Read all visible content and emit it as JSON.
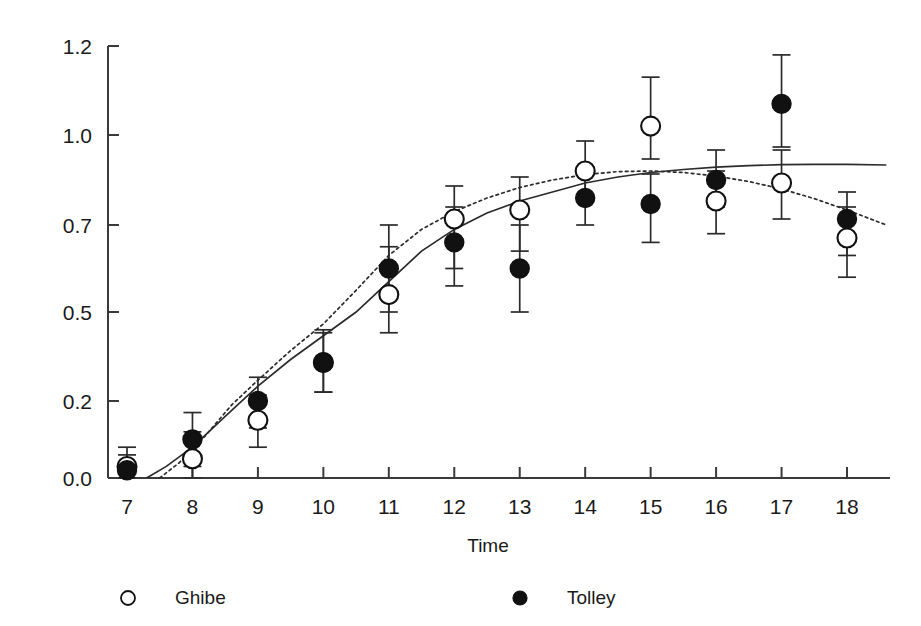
{
  "chart_data": {
    "type": "scatter",
    "title": "",
    "xlabel": "Time",
    "ylabel": "",
    "grid": false,
    "legend_position": "bottom",
    "x": [
      7,
      8,
      9,
      10,
      11,
      12,
      13,
      14,
      15,
      16,
      17,
      18
    ],
    "xtick_labels": [
      "7",
      "8",
      "9",
      "10",
      "11",
      "12",
      "13",
      "14",
      "15",
      "16",
      "17",
      "18"
    ],
    "ytick_labels": [
      "0.0",
      "0.2",
      "0.5",
      "0.7",
      "1.0",
      "1.2"
    ],
    "ytick_values": [
      0.0,
      0.2,
      0.5,
      0.7,
      1.0,
      1.2
    ],
    "xlim": [
      6.6,
      18.6
    ],
    "ylim": [
      0.0,
      1.2
    ],
    "series": [
      {
        "name": "Ghibe",
        "marker": "open-circle",
        "curve": "dotted",
        "values": [
          0.03,
          0.05,
          0.15,
          0.33,
          0.54,
          0.72,
          0.75,
          0.88,
          1.02,
          0.78,
          0.84,
          0.67
        ],
        "err_low": [
          0.03,
          0.05,
          0.07,
          0.1,
          0.11,
          0.12,
          0.11,
          0.1,
          0.1,
          0.1,
          0.12,
          0.09
        ],
        "err_high": [
          0.05,
          0.07,
          0.07,
          0.11,
          0.11,
          0.11,
          0.11,
          0.1,
          0.11,
          0.1,
          0.11,
          0.09
        ]
      },
      {
        "name": "Tolley",
        "marker": "filled-circle",
        "curve": "solid",
        "values": [
          0.02,
          0.1,
          0.2,
          0.33,
          0.6,
          0.66,
          0.6,
          0.79,
          0.77,
          0.85,
          1.07,
          0.72
        ],
        "err_low": [
          0.02,
          0.07,
          0.07,
          0.1,
          0.1,
          0.1,
          0.1,
          0.09,
          0.11,
          0.09,
          0.11,
          0.09
        ],
        "err_high": [
          0.04,
          0.07,
          0.08,
          0.1,
          0.1,
          0.1,
          0.1,
          0.09,
          0.1,
          0.1,
          0.11,
          0.09
        ]
      }
    ],
    "fitted_curves": [
      {
        "name": "Tolley fit",
        "style": "solid",
        "points": [
          [
            7.3,
            0.0
          ],
          [
            7.6,
            0.03
          ],
          [
            8.0,
            0.08
          ],
          [
            8.5,
            0.16
          ],
          [
            9.0,
            0.25
          ],
          [
            9.5,
            0.34
          ],
          [
            10.0,
            0.42
          ],
          [
            10.5,
            0.5
          ],
          [
            11.0,
            0.57
          ],
          [
            11.5,
            0.64
          ],
          [
            12.0,
            0.69
          ],
          [
            12.5,
            0.74
          ],
          [
            13.0,
            0.78
          ],
          [
            13.5,
            0.81
          ],
          [
            14.0,
            0.84
          ],
          [
            14.5,
            0.86
          ],
          [
            15.0,
            0.875
          ],
          [
            15.5,
            0.885
          ],
          [
            16.0,
            0.893
          ],
          [
            16.5,
            0.898
          ],
          [
            17.0,
            0.901
          ],
          [
            17.5,
            0.902
          ],
          [
            18.0,
            0.902
          ],
          [
            18.6,
            0.9
          ]
        ]
      },
      {
        "name": "Ghibe fit",
        "style": "dotted",
        "points": [
          [
            7.5,
            0.0
          ],
          [
            7.8,
            0.04
          ],
          [
            8.2,
            0.11
          ],
          [
            8.6,
            0.19
          ],
          [
            9.0,
            0.27
          ],
          [
            9.5,
            0.37
          ],
          [
            10.0,
            0.46
          ],
          [
            10.5,
            0.55
          ],
          [
            11.0,
            0.63
          ],
          [
            11.5,
            0.69
          ],
          [
            12.0,
            0.745
          ],
          [
            12.5,
            0.79
          ],
          [
            13.0,
            0.825
          ],
          [
            13.5,
            0.85
          ],
          [
            14.0,
            0.868
          ],
          [
            14.5,
            0.878
          ],
          [
            15.0,
            0.88
          ],
          [
            15.5,
            0.875
          ],
          [
            16.0,
            0.863
          ],
          [
            16.5,
            0.845
          ],
          [
            17.0,
            0.82
          ],
          [
            17.5,
            0.788
          ],
          [
            18.0,
            0.75
          ],
          [
            18.6,
            0.7
          ]
        ]
      }
    ],
    "legend": [
      {
        "label": "Ghibe",
        "marker": "open-circle"
      },
      {
        "label": "Tolley",
        "marker": "filled-circle"
      }
    ]
  },
  "colors": {
    "axis": "#3a3a3a",
    "marker_fill": "#111111",
    "marker_open": "#ffffff",
    "curve": "#2b2b2b",
    "background": "#ffffff"
  }
}
